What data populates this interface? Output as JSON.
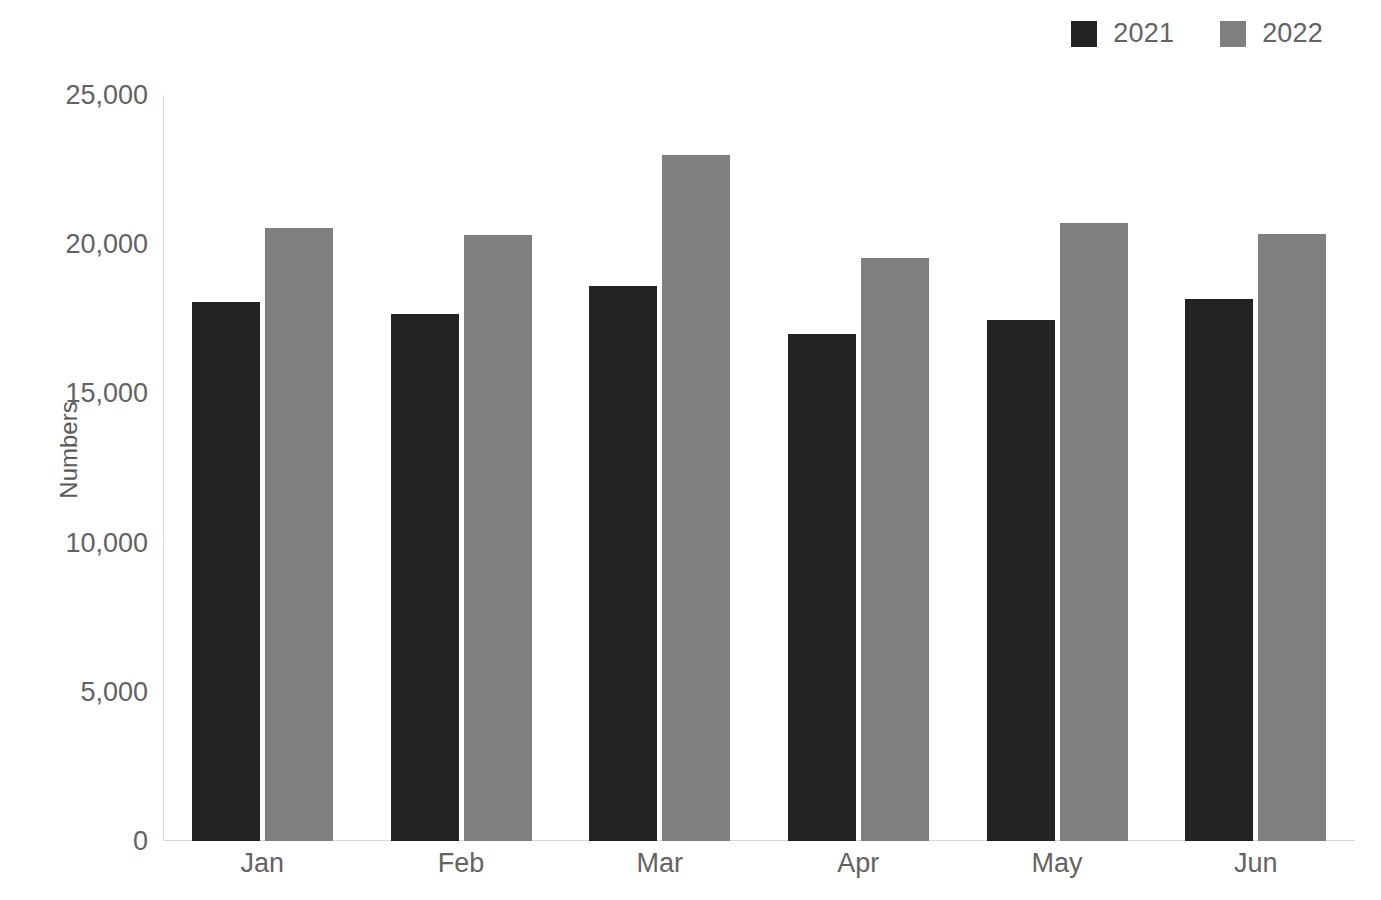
{
  "chart_data": {
    "type": "bar",
    "title": "",
    "subtitle": "",
    "xlabel": "",
    "ylabel": "Numbers",
    "categories": [
      "Jan",
      "Feb",
      "Mar",
      "Apr",
      "May",
      "Jun"
    ],
    "series": [
      {
        "name": "2021",
        "color": "#232323",
        "values": [
          18050,
          17650,
          18600,
          17000,
          17450,
          18150
        ]
      },
      {
        "name": "2022",
        "color": "#7f7f7f",
        "values": [
          20550,
          20300,
          23000,
          19550,
          20700,
          20350
        ]
      }
    ],
    "ylim": [
      0,
      25000
    ],
    "ytick_values": [
      0,
      5000,
      10000,
      15000,
      20000,
      25000
    ],
    "ytick_labels": [
      "0",
      "5,000",
      "10,000",
      "15,000",
      "20,000",
      "25,000"
    ],
    "grid": false,
    "legend_position": "top-right",
    "axis_color": "#d9d9d9",
    "text_color": "#636363"
  },
  "legend": {
    "items": [
      {
        "label": "2021",
        "swatch_name": "legend-swatch-2021"
      },
      {
        "label": "2022",
        "swatch_name": "legend-swatch-2022"
      }
    ]
  }
}
